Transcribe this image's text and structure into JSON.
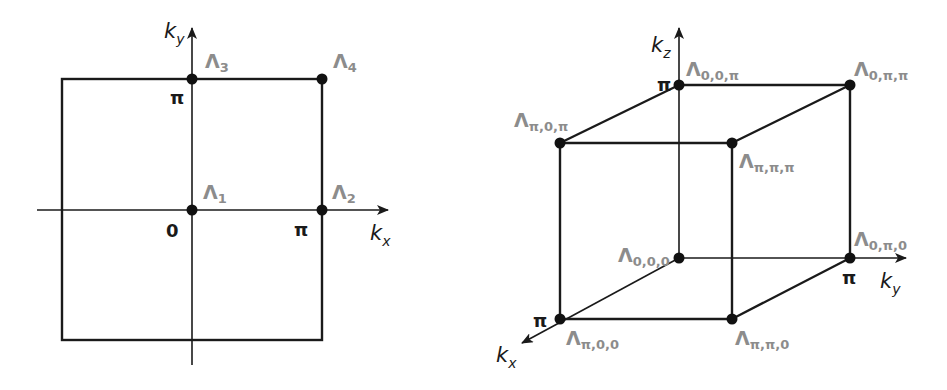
{
  "figure_2d": {
    "axes": {
      "x_label": "k",
      "x_sub": "x",
      "y_label": "k",
      "y_sub": "y"
    },
    "ticks": {
      "origin": "0",
      "x_pi": "π",
      "y_pi": "π"
    },
    "points": [
      {
        "id": "Λ1",
        "base": "Λ",
        "sub": "1",
        "coords": "(0,0)"
      },
      {
        "id": "Λ2",
        "base": "Λ",
        "sub": "2",
        "coords": "(π,0)"
      },
      {
        "id": "Λ3",
        "base": "Λ",
        "sub": "3",
        "coords": "(0,π)"
      },
      {
        "id": "Λ4",
        "base": "Λ",
        "sub": "4",
        "coords": "(π,π)"
      }
    ]
  },
  "figure_3d": {
    "axes": {
      "x_label": "k",
      "x_sub": "x",
      "y_label": "k",
      "y_sub": "y",
      "z_label": "k",
      "z_sub": "z"
    },
    "ticks": {
      "x_pi": "π",
      "y_pi": "π",
      "z_pi": "π"
    },
    "points": [
      {
        "id": "Λ0,0,0",
        "base": "Λ",
        "sub": "0,0,0"
      },
      {
        "id": "Λ0,π,0",
        "base": "Λ",
        "sub": "0,π,0"
      },
      {
        "id": "Λ0,0,π",
        "base": "Λ",
        "sub": "0,0,π"
      },
      {
        "id": "Λ0,π,π",
        "base": "Λ",
        "sub": "0,π,π"
      },
      {
        "id": "Λπ,0,0",
        "base": "Λ",
        "sub": "π,0,0"
      },
      {
        "id": "Λπ,π,0",
        "base": "Λ",
        "sub": "π,π,0"
      },
      {
        "id": "Λπ,0,π",
        "base": "Λ",
        "sub": "π,0,π"
      },
      {
        "id": "Λπ,π,π",
        "base": "Λ",
        "sub": "π,π,π"
      }
    ]
  },
  "colors": {
    "line": "#1a1a1a",
    "label": "#8c8c8c",
    "background": "#ffffff"
  }
}
